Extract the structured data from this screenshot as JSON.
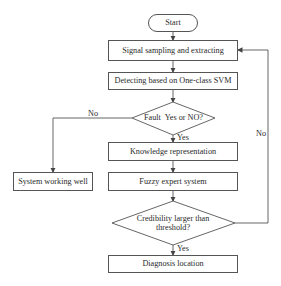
{
  "diagram": {
    "type": "flowchart",
    "nodes": {
      "start": "Start",
      "signal": "Signal sampling and extracting",
      "detect": "Detecting based on One-class SVM",
      "fault_decision": "Fault  Yes or NO?",
      "knowledge": "Knowledge representation",
      "working_well": "System working well",
      "fuzzy": "Fuzzy expert system",
      "credibility_line1": "Credibility larger than",
      "credibility_line2": "threshold?",
      "diagnosis": "Diagnosis location"
    },
    "edge_labels": {
      "fault_no": "No",
      "fault_yes": "Yes",
      "credibility_no": "No",
      "credibility_yes": "Yes"
    },
    "edges": [
      {
        "from": "start",
        "to": "signal"
      },
      {
        "from": "signal",
        "to": "detect"
      },
      {
        "from": "detect",
        "to": "fault_decision"
      },
      {
        "from": "fault_decision",
        "to": "knowledge",
        "label": "Yes"
      },
      {
        "from": "fault_decision",
        "to": "working_well",
        "label": "No"
      },
      {
        "from": "knowledge",
        "to": "fuzzy"
      },
      {
        "from": "fuzzy",
        "to": "credibility"
      },
      {
        "from": "credibility",
        "to": "diagnosis",
        "label": "Yes"
      },
      {
        "from": "credibility",
        "to": "signal",
        "label": "No"
      }
    ],
    "colors": {
      "stroke": "#555555",
      "text": "#2a2a2a",
      "background": "#ffffff"
    }
  }
}
